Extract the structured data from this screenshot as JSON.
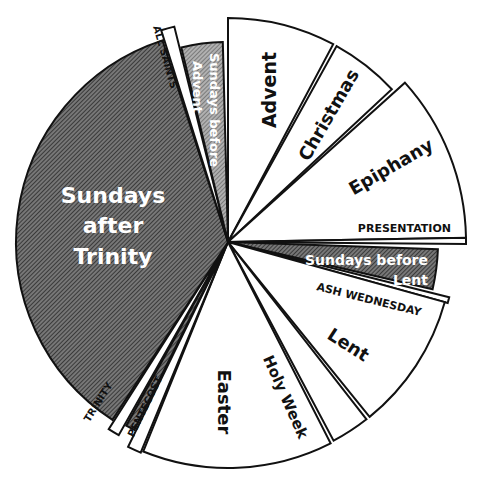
{
  "chart_data": {
    "type": "pie",
    "title": "",
    "center": [
      228,
      242
    ],
    "colors": {
      "hatched_dark": "#5a5a5a",
      "hatched_light": "#8c8c8c",
      "white": "#ffffff",
      "outline": "#111111"
    },
    "slices": [
      {
        "name": "Advent",
        "start": 270,
        "end": 298,
        "r": 224,
        "fill": "white"
      },
      {
        "name": "Christmas",
        "start": 299,
        "end": 317,
        "r": 224,
        "fill": "white"
      },
      {
        "name": "Epiphany",
        "start": 318,
        "end": 359,
        "r": 238,
        "fill": "white"
      },
      {
        "name": "PRESENTATION",
        "start": 359,
        "end": 360.5,
        "r": 238,
        "fill": "white"
      },
      {
        "name": "Sundays before Lent",
        "start": 2,
        "end": 13,
        "r": 210,
        "fill": "hatched_dark"
      },
      {
        "name": "ASH WEDNESDAY",
        "start": 14,
        "end": 15.5,
        "r": 228,
        "fill": "white"
      },
      {
        "name": "Lent",
        "start": 15.5,
        "end": 51,
        "r": 225,
        "fill": "white"
      },
      {
        "name": "Holy Week",
        "start": 52,
        "end": 62,
        "r": 225,
        "fill": "white"
      },
      {
        "name": "Easter",
        "start": 63,
        "end": 112,
        "r": 226,
        "fill": "white"
      },
      {
        "name": "PENTECOST",
        "start": 112.5,
        "end": 116,
        "r": 228,
        "fill": "white"
      },
      {
        "name": "Sundays after Pentecost (hatched)",
        "start": 116.5,
        "end": 119,
        "r": 210,
        "fill": "hatched_dark"
      },
      {
        "name": "TRINITY",
        "start": 119.5,
        "end": 122.5,
        "r": 222,
        "fill": "white"
      },
      {
        "name": "Sundays after Trinity",
        "start": 123,
        "end": 252,
        "r": 212,
        "fill": "hatched_dark"
      },
      {
        "name": "ALL SAINTS",
        "start": 252.5,
        "end": 256,
        "r": 222,
        "fill": "white"
      },
      {
        "name": "Sundays before Advent",
        "start": 256.5,
        "end": 268.5,
        "r": 200,
        "fill": "hatched_light"
      }
    ],
    "labels": {
      "advent": "Advent",
      "christmas": "Christmas",
      "epiphany": "Epiphany",
      "presentation": "PRESENTATION",
      "sundays_before_lent_1": "Sundays before",
      "sundays_before_lent_2": "Lent",
      "ash_wednesday": "ASH WEDNESDAY",
      "lent": "Lent",
      "holy_week": "Holy Week",
      "easter": "Easter",
      "pentecost": "PENTECOST",
      "trinity": "TRINITY",
      "sundays_after_trinity_1": "Sundays",
      "sundays_after_trinity_2": "after",
      "sundays_after_trinity_3": "Trinity",
      "all_saints": "ALL SAINTS",
      "sundays_before_advent_1": "Sundays before",
      "sundays_before_advent_2": "Advent"
    },
    "legend": null,
    "xlabel": "",
    "ylabel": ""
  }
}
